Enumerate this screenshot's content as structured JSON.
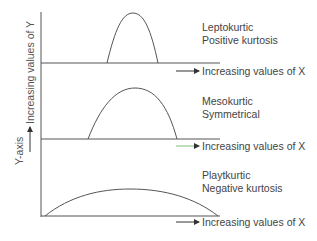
{
  "axes": {
    "y_axis_label": "Y-axis",
    "y_direction_label": "Increasing values of Y",
    "x_label": "Increasing values of X"
  },
  "curves": [
    {
      "name": "Leptokurtic",
      "description": "Positive kurtosis"
    },
    {
      "name": "Mesokurtic",
      "description": "Symmetrical"
    },
    {
      "name": "Playtkurtic",
      "description": "Negative kurtosis"
    }
  ],
  "colors": {
    "line": "#555555",
    "text": "#444444",
    "middle_arrow": "#7ec07e"
  }
}
